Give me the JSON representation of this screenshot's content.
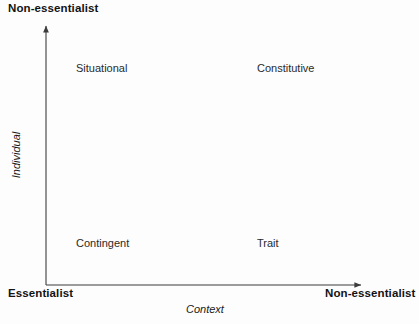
{
  "diagram": {
    "type": "two-by-two-matrix",
    "axes": {
      "y": {
        "name": "Individual",
        "low_pole": "Essentialist",
        "high_pole": "Non-essentialist"
      },
      "x": {
        "name": "Context",
        "low_pole": "Essentialist",
        "high_pole": "Non-essentialist"
      }
    },
    "poles": {
      "top_left": "Non-essentialist",
      "bottom_left": "Essentialist",
      "bottom_right": "Non-essentialist"
    },
    "quadrants": [
      {
        "id": "top-left",
        "label": "Situational"
      },
      {
        "id": "top-right",
        "label": "Constitutive"
      },
      {
        "id": "bottom-left",
        "label": "Contingent"
      },
      {
        "id": "bottom-right",
        "label": "Trait"
      }
    ],
    "colors": {
      "background": "#fdfdfd",
      "axis_line": "#3c3c3c",
      "text": "#1a1a1a"
    }
  }
}
